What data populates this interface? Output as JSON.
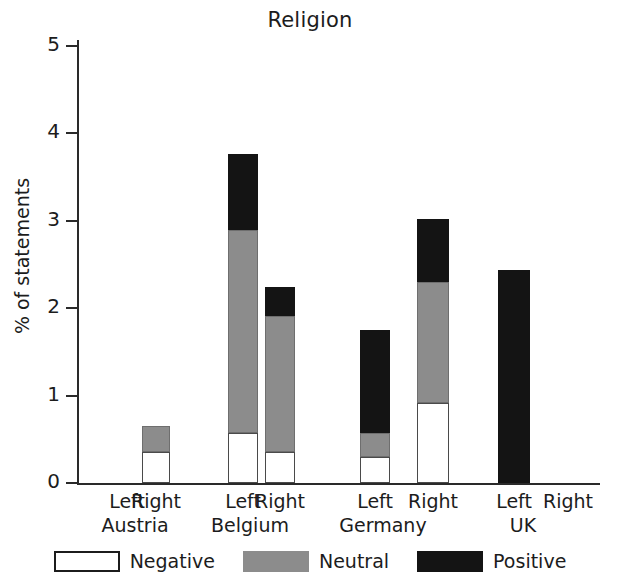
{
  "chart_data": {
    "type": "bar",
    "subtype": "stacked-bar-grouped",
    "title": "Religion",
    "xlabel": "",
    "ylabel": "% of statements",
    "ylim": [
      0,
      5
    ],
    "yticks": [
      "0",
      "1",
      "2",
      "3",
      "4",
      "5"
    ],
    "grid": false,
    "legend_position": "bottom",
    "legend": [
      "Negative",
      "Neutral",
      "Positive"
    ],
    "colors": {
      "negative": "#ffffff",
      "neutral": "#8c8c8c",
      "positive": "#141414",
      "axis": "#2a2a2a",
      "text": "#1c1c1c"
    },
    "groups": [
      "Austria",
      "Belgium",
      "Germany",
      "UK"
    ],
    "sides": [
      "Left",
      "Right"
    ],
    "categories": [
      "Austria Left",
      "Austria Right",
      "Belgium Left",
      "Belgium Right",
      "Germany Left",
      "Germany Right",
      "UK Left",
      "UK Right"
    ],
    "series": [
      {
        "name": "Negative",
        "values": [
          0,
          0.35,
          0.57,
          0.36,
          0.3,
          0.92,
          0,
          0
        ]
      },
      {
        "name": "Neutral",
        "values": [
          0,
          0.3,
          2.32,
          1.55,
          0.27,
          1.38,
          0,
          0
        ]
      },
      {
        "name": "Positive",
        "values": [
          0,
          0,
          0.87,
          0.33,
          1.18,
          0.72,
          2.44,
          0
        ]
      }
    ],
    "totals": [
      0,
      0.65,
      3.76,
      2.24,
      1.75,
      3.02,
      2.44,
      0
    ],
    "bars": [
      {
        "group": "Austria",
        "side": "Left",
        "negative": 0,
        "neutral": 0,
        "positive": 0,
        "total": 0,
        "x": 113,
        "width": 28
      },
      {
        "group": "Austria",
        "side": "Right",
        "negative": 0.35,
        "neutral": 0.3,
        "positive": 0,
        "total": 0.65,
        "x": 142,
        "width": 28
      },
      {
        "group": "Belgium",
        "side": "Left",
        "negative": 0.57,
        "neutral": 2.32,
        "positive": 0.87,
        "total": 3.76,
        "x": 228,
        "width": 30
      },
      {
        "group": "Belgium",
        "side": "Right",
        "negative": 0.36,
        "neutral": 1.55,
        "positive": 0.33,
        "total": 2.24,
        "x": 265,
        "width": 30
      },
      {
        "group": "Germany",
        "side": "Left",
        "negative": 0.3,
        "neutral": 0.27,
        "positive": 1.18,
        "total": 1.75,
        "x": 360,
        "width": 30
      },
      {
        "group": "Germany",
        "side": "Right",
        "negative": 0.92,
        "neutral": 1.38,
        "positive": 0.72,
        "total": 3.02,
        "x": 417,
        "width": 32
      },
      {
        "group": "UK",
        "side": "Left",
        "negative": 0,
        "neutral": 0,
        "positive": 2.44,
        "total": 2.44,
        "x": 498,
        "width": 32
      },
      {
        "group": "UK",
        "side": "Right",
        "negative": 0,
        "neutral": 0,
        "positive": 0,
        "total": 0,
        "x": 552,
        "width": 32
      }
    ],
    "group_label_positions": [
      {
        "label": "Austria",
        "left_x": 113,
        "right_x": 156,
        "center_x": 135
      },
      {
        "label": "Belgium",
        "left_x": 228,
        "right_x": 272,
        "center_x": 250
      },
      {
        "label": "Germany",
        "left_x": 360,
        "right_x": 405,
        "center_x": 383
      },
      {
        "label": "UK",
        "left_x": 498,
        "right_x": 548,
        "center_x": 523
      }
    ]
  }
}
